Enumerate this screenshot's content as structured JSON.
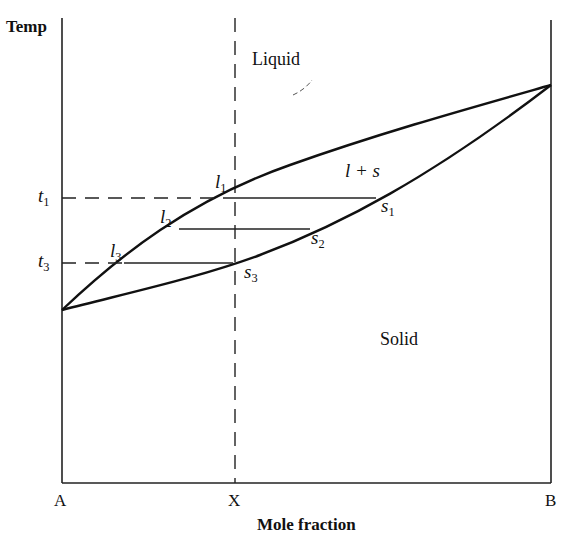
{
  "diagram": {
    "y_axis_label": "Temp",
    "x_axis_label": "Mole fraction",
    "x_ticks": {
      "a": "A",
      "x": "X",
      "b": "B"
    },
    "y_ticks": {
      "t1": {
        "main": "t",
        "sub": "1"
      },
      "t3": {
        "main": "t",
        "sub": "3"
      }
    },
    "regions": {
      "liquid": "Liquid",
      "solid": "Solid",
      "two_phase": "l + s"
    },
    "points": {
      "l1": {
        "main": "l",
        "sub": "1"
      },
      "l2": {
        "main": "l",
        "sub": "2"
      },
      "l3": {
        "main": "l",
        "sub": "3"
      },
      "s1": {
        "main": "s",
        "sub": "1"
      },
      "s2": {
        "main": "s",
        "sub": "2"
      },
      "s3": {
        "main": "s",
        "sub": "3"
      }
    },
    "colors": {
      "line": "#111111",
      "background": "#ffffff"
    }
  }
}
